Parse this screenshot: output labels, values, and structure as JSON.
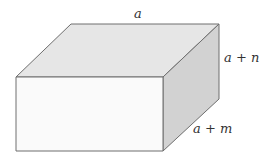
{
  "figure": {
    "type": "rectangular box (cuboid) in oblique projection",
    "labels": {
      "top_edge": "a",
      "depth_edge": "a + n",
      "bottom_right_edge": "a + m"
    },
    "colors": {
      "top_face": "#e6e6e6",
      "front_face": "#fafafa",
      "side_face": "#d2d2d2",
      "edge": "#6e6e6e"
    }
  }
}
